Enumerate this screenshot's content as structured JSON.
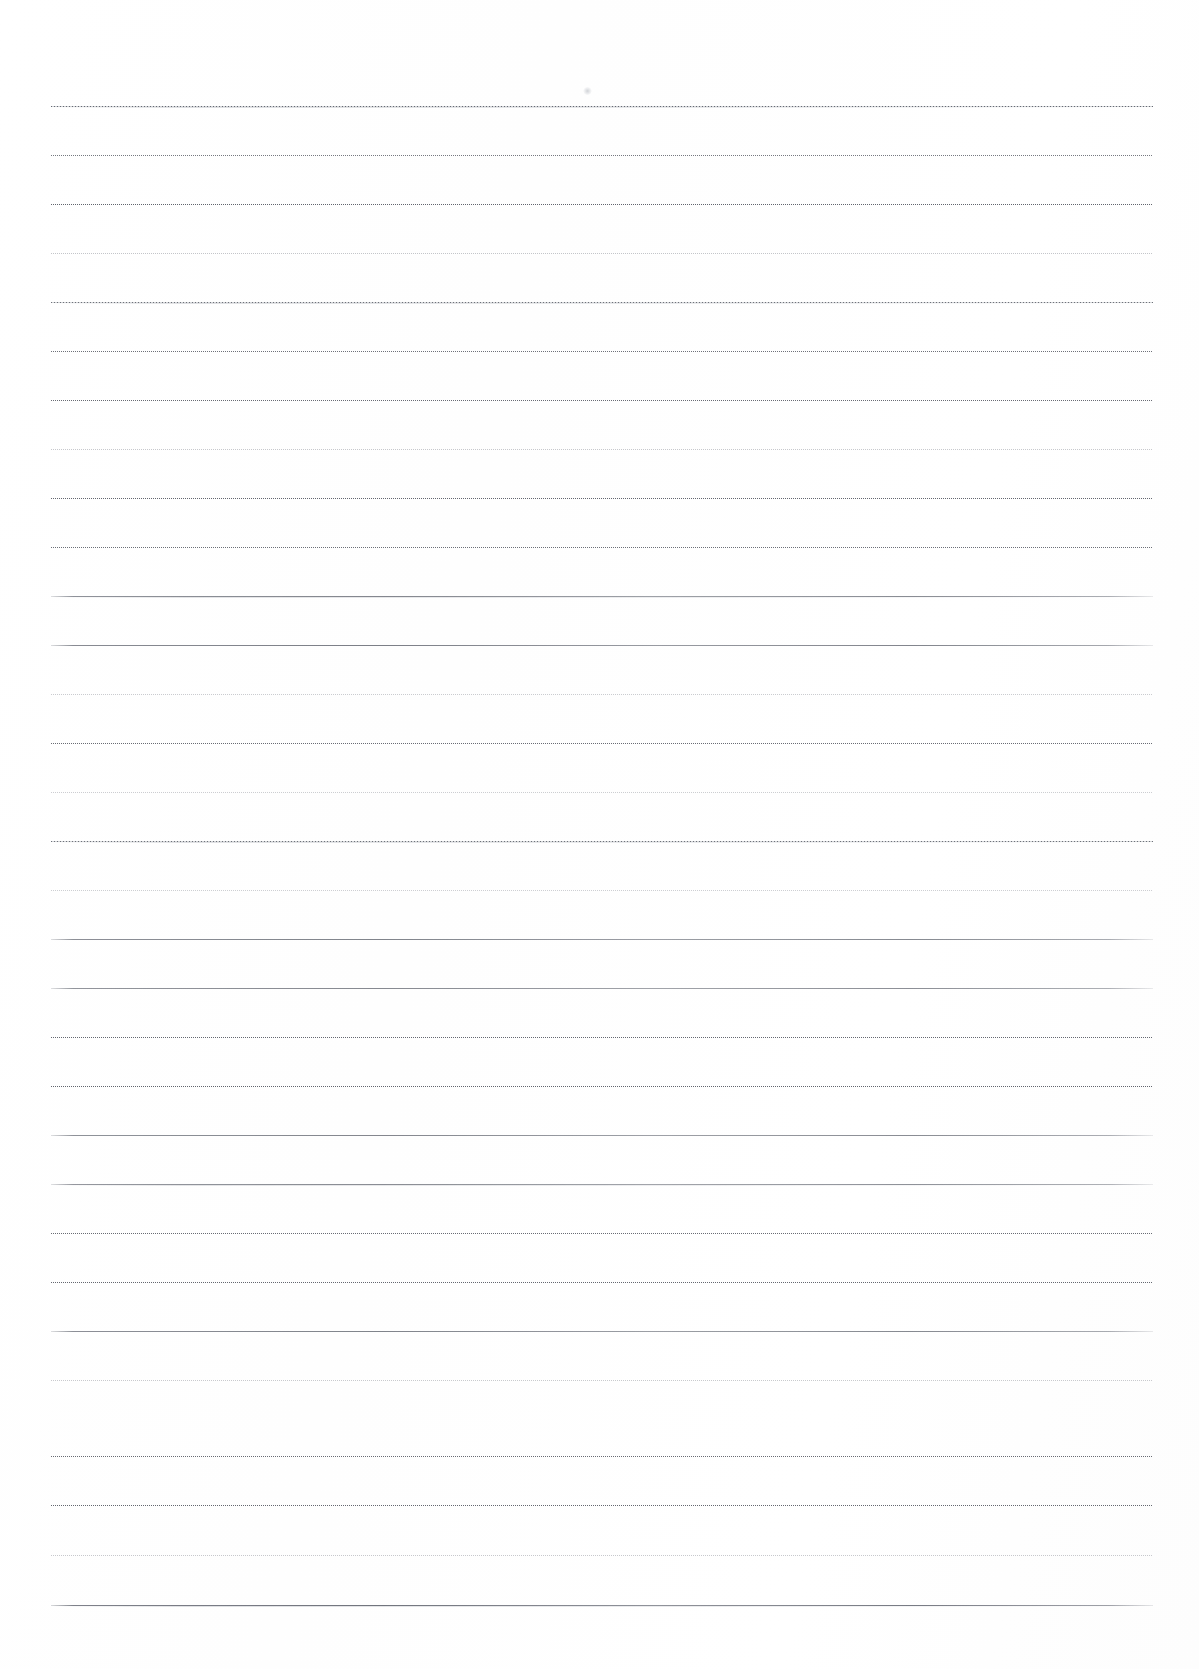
{
  "page": {
    "width": 1199,
    "height": 1669,
    "background_color": "#ffffff",
    "paper_tone": "#fefefe",
    "content_text": ""
  },
  "ruling": {
    "type": "horizontal-ruled",
    "line_count": 31,
    "first_line_y": 106,
    "line_spacing": 50,
    "left_x": 51,
    "right_x": 1153,
    "line_width": 1102,
    "ink_color": "#5a5e68",
    "faint_ink_color": "#8d919a"
  },
  "lines": [
    {
      "index": 1,
      "y": 106,
      "x1": 51,
      "x2": 1153,
      "style": "mixed",
      "opacity": 0.95,
      "ghost": true
    },
    {
      "index": 2,
      "y": 155,
      "x1": 51,
      "x2": 1153,
      "style": "dotted",
      "opacity": 0.8,
      "ghost": false
    },
    {
      "index": 3,
      "y": 204,
      "x1": 51,
      "x2": 1153,
      "style": "dotted",
      "opacity": 0.92,
      "ghost": false
    },
    {
      "index": 4,
      "y": 253,
      "x1": 51,
      "x2": 1153,
      "style": "faint",
      "opacity": 0.7,
      "ghost": false
    },
    {
      "index": 5,
      "y": 302,
      "x1": 51,
      "x2": 1153,
      "style": "mixed",
      "opacity": 0.9,
      "ghost": true
    },
    {
      "index": 6,
      "y": 351,
      "x1": 51,
      "x2": 1153,
      "style": "dotted",
      "opacity": 0.85,
      "ghost": false
    },
    {
      "index": 7,
      "y": 400,
      "x1": 51,
      "x2": 1153,
      "style": "dotted",
      "opacity": 0.88,
      "ghost": false
    },
    {
      "index": 8,
      "y": 449,
      "x1": 51,
      "x2": 1153,
      "style": "faint",
      "opacity": 0.66,
      "ghost": false
    },
    {
      "index": 9,
      "y": 498,
      "x1": 51,
      "x2": 1153,
      "style": "dotted",
      "opacity": 0.9,
      "ghost": false
    },
    {
      "index": 10,
      "y": 547,
      "x1": 51,
      "x2": 1153,
      "style": "dotted",
      "opacity": 0.86,
      "ghost": false
    },
    {
      "index": 11,
      "y": 596,
      "x1": 51,
      "x2": 1153,
      "style": "solid",
      "opacity": 0.8,
      "ghost": true
    },
    {
      "index": 12,
      "y": 645,
      "x1": 51,
      "x2": 1153,
      "style": "solid",
      "opacity": 0.85,
      "ghost": false
    },
    {
      "index": 13,
      "y": 694,
      "x1": 51,
      "x2": 1153,
      "style": "faint",
      "opacity": 0.62,
      "ghost": false
    },
    {
      "index": 14,
      "y": 743,
      "x1": 51,
      "x2": 1153,
      "style": "dotted",
      "opacity": 0.88,
      "ghost": false
    },
    {
      "index": 15,
      "y": 792,
      "x1": 51,
      "x2": 1153,
      "style": "faint",
      "opacity": 0.6,
      "ghost": false
    },
    {
      "index": 16,
      "y": 841,
      "x1": 51,
      "x2": 1153,
      "style": "mixed",
      "opacity": 0.9,
      "ghost": true
    },
    {
      "index": 17,
      "y": 890,
      "x1": 51,
      "x2": 1153,
      "style": "faint",
      "opacity": 0.58,
      "ghost": false
    },
    {
      "index": 18,
      "y": 939,
      "x1": 51,
      "x2": 1153,
      "style": "solid",
      "opacity": 0.82,
      "ghost": false
    },
    {
      "index": 19,
      "y": 988,
      "x1": 51,
      "x2": 1153,
      "style": "solid",
      "opacity": 0.78,
      "ghost": false
    },
    {
      "index": 20,
      "y": 1037,
      "x1": 51,
      "x2": 1153,
      "style": "dotted",
      "opacity": 0.9,
      "ghost": false
    },
    {
      "index": 21,
      "y": 1086,
      "x1": 51,
      "x2": 1153,
      "style": "dotted",
      "opacity": 0.92,
      "ghost": false
    },
    {
      "index": 22,
      "y": 1135,
      "x1": 51,
      "x2": 1153,
      "style": "solid",
      "opacity": 0.8,
      "ghost": false
    },
    {
      "index": 23,
      "y": 1184,
      "x1": 51,
      "x2": 1153,
      "style": "solid",
      "opacity": 0.76,
      "ghost": true
    },
    {
      "index": 24,
      "y": 1233,
      "x1": 51,
      "x2": 1153,
      "style": "dotted",
      "opacity": 0.88,
      "ghost": false
    },
    {
      "index": 25,
      "y": 1282,
      "x1": 51,
      "x2": 1153,
      "style": "dotted",
      "opacity": 0.9,
      "ghost": false
    },
    {
      "index": 26,
      "y": 1331,
      "x1": 51,
      "x2": 1153,
      "style": "solid",
      "opacity": 0.82,
      "ghost": false
    },
    {
      "index": 27,
      "y": 1380,
      "x1": 51,
      "x2": 1153,
      "style": "faint",
      "opacity": 0.64,
      "ghost": false
    },
    {
      "index": 28,
      "y": 1456,
      "x1": 51,
      "x2": 1153,
      "style": "dotted",
      "opacity": 0.88,
      "ghost": false
    },
    {
      "index": 29,
      "y": 1505,
      "x1": 51,
      "x2": 1153,
      "style": "dotted",
      "opacity": 0.9,
      "ghost": false
    },
    {
      "index": 30,
      "y": 1555,
      "x1": 51,
      "x2": 1153,
      "style": "faint",
      "opacity": 0.66,
      "ghost": false
    },
    {
      "index": 31,
      "y": 1605,
      "x1": 51,
      "x2": 1153,
      "style": "solid",
      "opacity": 0.92,
      "ghost": true
    }
  ],
  "artifacts": [
    {
      "name": "dust-speck",
      "x": 583,
      "y": 87,
      "width": 9,
      "height": 8,
      "color": "#b0b4bc"
    }
  ]
}
